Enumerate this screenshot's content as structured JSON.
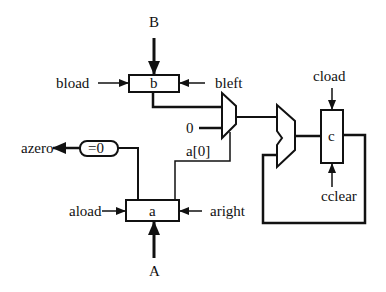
{
  "diagram": {
    "type": "datapath",
    "inputs": {
      "B": "B",
      "A": "A"
    },
    "registers": [
      {
        "id": "b",
        "label": "b"
      },
      {
        "id": "a",
        "label": "a"
      },
      {
        "id": "c",
        "label": "c"
      }
    ],
    "control_signals": {
      "bload": "bload",
      "bleft": "bleft",
      "aload": "aload",
      "aright": "aright",
      "cload": "cload",
      "cclear": "cclear"
    },
    "outputs": {
      "azero": "azero"
    },
    "comparator": {
      "label": "=0"
    },
    "mux": {
      "const_input": "0",
      "select_label": "a[0]"
    },
    "adder": {
      "label": ""
    },
    "colors": {
      "stroke": "#111111",
      "background": "#ffffff"
    }
  }
}
